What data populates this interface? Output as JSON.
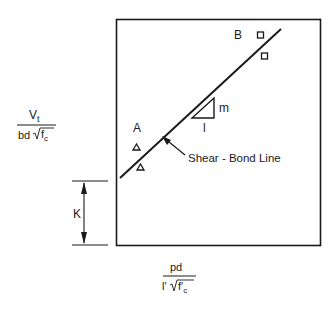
{
  "diagram": {
    "type": "shear-bond regression plot",
    "y_axis": {
      "numerator": "V",
      "numerator_sub": "t",
      "denominator_prefix": "bd",
      "denominator_root": "f",
      "denominator_root_sub": "c"
    },
    "x_axis": {
      "numerator": "pd",
      "denominator_prefix": "l'",
      "denominator_root": "f'",
      "denominator_root_sub": "c"
    },
    "regions": {
      "region_a": "A",
      "region_b": "B"
    },
    "line": {
      "label": "Shear - Bond Line"
    },
    "slope_triangle": {
      "rise_label": "m",
      "run_label": "l"
    },
    "intercept": {
      "label": "K"
    },
    "markers": {
      "region_a_symbol": "triangle",
      "region_a_count": 2,
      "region_b_symbol": "square",
      "region_b_count": 2
    },
    "colors": {
      "ink": "#1a1a1a",
      "background": "#ffffff"
    }
  }
}
